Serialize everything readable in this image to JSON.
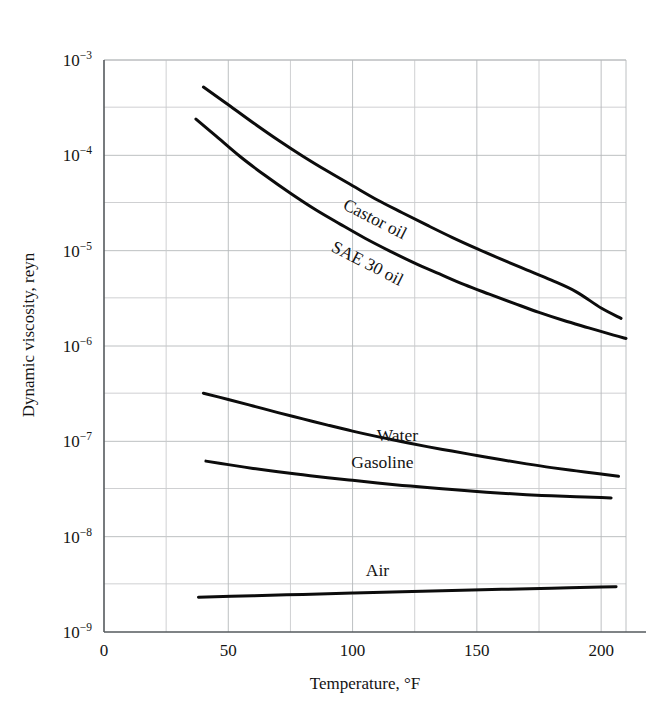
{
  "chart_data": {
    "type": "line",
    "title": "",
    "xlabel": "Temperature, °F",
    "ylabel": "Dynamic viscosity, reyn",
    "yscale": "log",
    "xlim": [
      0,
      210
    ],
    "ylim": [
      1e-09,
      0.001
    ],
    "xticks": [
      0,
      50,
      100,
      150,
      200
    ],
    "xtick_labels": [
      "0",
      "50",
      "100",
      "150",
      "200"
    ],
    "xgrid_minor": [
      25,
      75,
      125,
      175
    ],
    "yticks": [
      1e-09,
      1e-08,
      1e-07,
      1e-06,
      1e-05,
      0.0001,
      0.001
    ],
    "ytick_labels": [
      {
        "base": "10",
        "exp": "−9"
      },
      {
        "base": "10",
        "exp": "−8"
      },
      {
        "base": "10",
        "exp": "−7"
      },
      {
        "base": "10",
        "exp": "−6"
      },
      {
        "base": "10",
        "exp": "−5"
      },
      {
        "base": "10",
        "exp": "−4"
      },
      {
        "base": "10",
        "exp": "−3"
      }
    ],
    "ygrid_minor_decades": [
      3.2e-09,
      3.2e-08,
      3.2e-07,
      3.2e-06,
      3.2e-05,
      0.00032
    ],
    "grid": true,
    "legend": "inline-labels",
    "series": [
      {
        "name": "Castor oil",
        "label": "Castor oil",
        "label_rotation": 27,
        "label_x": 108,
        "label_y": 1.9e-05,
        "x": [
          40,
          50,
          60,
          70,
          80,
          90,
          100,
          110,
          120,
          130,
          140,
          150,
          160,
          170,
          180,
          190,
          200,
          208
        ],
        "y": [
          0.00052,
          0.00034,
          0.00022,
          0.000145,
          9.8e-05,
          6.8e-05,
          4.8e-05,
          3.4e-05,
          2.5e-05,
          1.85e-05,
          1.38e-05,
          1.05e-05,
          8.1e-06,
          6.3e-06,
          4.9e-06,
          3.7e-06,
          2.5e-06,
          1.95e-06
        ]
      },
      {
        "name": "SAE 30 oil",
        "label": "SAE 30 oil",
        "label_rotation": 27,
        "label_x": 105,
        "label_y": 6.5e-06,
        "x": [
          37,
          45,
          55,
          65,
          75,
          85,
          95,
          105,
          115,
          125,
          135,
          145,
          155,
          165,
          175,
          185,
          195,
          205,
          210
        ],
        "y": [
          0.00024,
          0.00016,
          9.6e-05,
          6.1e-05,
          4e-05,
          2.7e-05,
          1.9e-05,
          1.35e-05,
          9.9e-06,
          7.4e-06,
          5.7e-06,
          4.4e-06,
          3.5e-06,
          2.8e-06,
          2.25e-06,
          1.85e-06,
          1.55e-06,
          1.3e-06,
          1.2e-06
        ]
      },
      {
        "name": "Water",
        "label": "Water",
        "label_rotation": 0,
        "label_x": 118,
        "label_y": 1e-07,
        "x": [
          40,
          50,
          60,
          70,
          80,
          90,
          100,
          110,
          120,
          130,
          140,
          150,
          160,
          170,
          180,
          190,
          200,
          207
        ],
        "y": [
          3.2e-07,
          2.75e-07,
          2.35e-07,
          2e-07,
          1.72e-07,
          1.48e-07,
          1.28e-07,
          1.12e-07,
          9.9e-08,
          8.8e-08,
          7.9e-08,
          7.1e-08,
          6.4e-08,
          5.8e-08,
          5.3e-08,
          4.9e-08,
          4.55e-08,
          4.3e-08
        ]
      },
      {
        "name": "Gasoline",
        "label": "Gasoline",
        "label_rotation": 0,
        "label_x": 112,
        "label_y": 5.3e-08,
        "x": [
          41,
          50,
          60,
          70,
          80,
          90,
          100,
          110,
          120,
          130,
          140,
          150,
          160,
          170,
          180,
          190,
          200,
          204
        ],
        "y": [
          6.2e-08,
          5.7e-08,
          5.2e-08,
          4.8e-08,
          4.45e-08,
          4.15e-08,
          3.9e-08,
          3.65e-08,
          3.45e-08,
          3.28e-08,
          3.12e-08,
          2.98e-08,
          2.86e-08,
          2.76e-08,
          2.68e-08,
          2.62e-08,
          2.57e-08,
          2.55e-08
        ]
      },
      {
        "name": "Air",
        "label": "Air",
        "label_rotation": 0,
        "label_x": 110,
        "label_y": 3.9e-09,
        "x": [
          38,
          60,
          80,
          100,
          120,
          140,
          160,
          180,
          200,
          206
        ],
        "y": [
          2.32e-09,
          2.4e-09,
          2.48e-09,
          2.56e-09,
          2.64e-09,
          2.72e-09,
          2.8e-09,
          2.88e-09,
          2.96e-09,
          2.99e-09
        ]
      }
    ]
  }
}
